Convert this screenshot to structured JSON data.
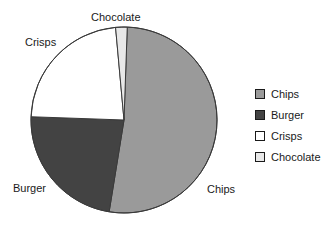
{
  "chart_data": {
    "type": "pie",
    "title": "",
    "labels": [
      "Chips",
      "Burger",
      "Crisps",
      "Chocolate"
    ],
    "values": [
      52,
      23,
      23,
      2
    ],
    "unit": "percent",
    "colors": [
      "#9a9a9a",
      "#434343",
      "#ffffff",
      "#e8e8e8"
    ],
    "start_angle_deg": 2,
    "direction": "clockwise",
    "legend_position": "right",
    "grid": false,
    "slice_labels": [
      {
        "name": "chips",
        "text": "Chips"
      },
      {
        "name": "burger",
        "text": "Burger"
      },
      {
        "name": "crisps",
        "text": "Crisps"
      },
      {
        "name": "chocolate",
        "text": "Chocolate"
      }
    ]
  },
  "legend": {
    "items": [
      {
        "label": "Chips",
        "color": "#9a9a9a"
      },
      {
        "label": "Burger",
        "color": "#434343"
      },
      {
        "label": "Crisps",
        "color": "#ffffff"
      },
      {
        "label": "Chocolate",
        "color": "#e8e8e8"
      }
    ]
  },
  "style": {
    "outline": "#3a3a3a",
    "text": "#1a1a1a",
    "background": "#ffffff"
  }
}
